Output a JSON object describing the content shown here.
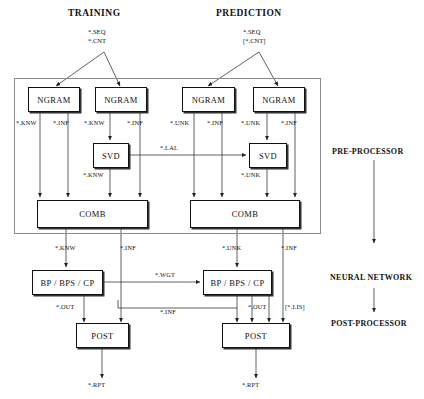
{
  "diagram": {
    "title_left": "TRAINING",
    "title_right": "PREDICTION",
    "input_training": {
      "line1": "*.SEQ",
      "line2": "*.CNT"
    },
    "input_prediction": {
      "line1": "*.SEQ",
      "line2": "[*.CNT]"
    },
    "stages": [
      {
        "id": "pre",
        "label": "PRE-PROCESSOR"
      },
      {
        "id": "nn",
        "label": "NEURAL NETWORK"
      },
      {
        "id": "post",
        "label": "POST-PROCESSOR"
      }
    ],
    "nodes": [
      {
        "id": "ngram-train-1",
        "label": "NGRAM"
      },
      {
        "id": "ngram-train-2",
        "label": "NGRAM"
      },
      {
        "id": "ngram-pred-1",
        "label": "NGRAM"
      },
      {
        "id": "ngram-pred-2",
        "label": "NGRAM"
      },
      {
        "id": "svd-train",
        "label": "SVD"
      },
      {
        "id": "svd-pred",
        "label": "SVD"
      },
      {
        "id": "comb-train",
        "label": "COMB"
      },
      {
        "id": "comb-pred",
        "label": "COMB"
      },
      {
        "id": "bp-train",
        "label": "BP / BPS / CP"
      },
      {
        "id": "bp-pred",
        "label": "BP / BPS / CP"
      },
      {
        "id": "post-train",
        "label": "POST"
      },
      {
        "id": "post-pred",
        "label": "POST"
      }
    ],
    "edge_labels": {
      "ngram_train1_knw": "*.KNW",
      "ngram_train1_inf": "*.INF",
      "ngram_train2_knw": "*.KNW",
      "ngram_train2_inf": "*.INF",
      "ngram_pred1_unk": "*.UNK",
      "ngram_pred1_inf": "*.INF",
      "ngram_pred2_unk": "*.UNK",
      "ngram_pred2_inf": "*.INF",
      "svd_lal": "*.LAL",
      "svd_train_knw": "*.KNW",
      "svd_pred_unk": "*.UNK",
      "comb_train_knw": "*.KNW",
      "comb_train_inf": "*.INF",
      "comb_pred_unk": "*.UNK",
      "comb_pred_inf": "*.INF",
      "bp_wgt": "*.WGT",
      "bp_train_out": "*.OUT",
      "bp_pred_out": "*.OUT",
      "bp_inf_feedback": "*.INF",
      "bp_pred_lis": "[*.LIS]",
      "post_train_rpt": "*.RPT",
      "post_pred_rpt": "*.RPT"
    },
    "colors": {
      "stroke": "#111111",
      "container_stroke": "#8a8a8a",
      "background": "#ffffff"
    }
  }
}
